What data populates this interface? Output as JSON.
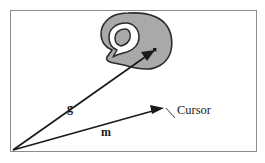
{
  "figure": {
    "background_color": "#ffffff",
    "frame": {
      "stroke_color": "#8c8c8c",
      "fill_color": "#ffffff",
      "x": 10,
      "y": 10,
      "width": 247,
      "height": 142
    },
    "origin": {
      "label": "origin",
      "x": 13,
      "y": 150
    },
    "blob": {
      "name": "target-region",
      "fill_color": "#a9a9a9",
      "stroke_color": "#2b2b2b",
      "notch_fill_color": "#ffffff"
    },
    "target_point": {
      "label": "target-point",
      "color": "#1a1a1a",
      "x": 155,
      "y": 50
    },
    "vectors": [
      {
        "id": "g",
        "label": "g",
        "label_x": 70,
        "label_y": 112,
        "color": "#1a1a1a",
        "from_x": 13,
        "from_y": 150,
        "to_x": 155,
        "to_y": 50
      },
      {
        "id": "m",
        "label": "m",
        "label_x": 106,
        "label_y": 136,
        "color": "#1a1a1a",
        "from_x": 13,
        "from_y": 150,
        "to_x": 163,
        "to_y": 108
      }
    ],
    "callout": {
      "label": "Cursor",
      "label_x": 177,
      "label_y": 114,
      "color": "#1a1a1a",
      "leader_from_x": 175,
      "leader_from_y": 118,
      "leader_to_x": 166,
      "leader_to_y": 108
    }
  }
}
